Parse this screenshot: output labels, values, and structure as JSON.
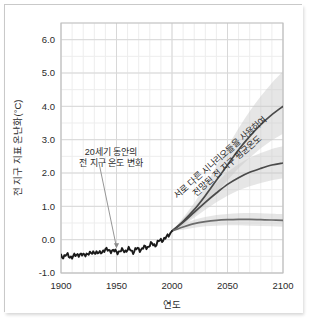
{
  "chart_data": {
    "type": "line",
    "title": "",
    "xlabel": "연도",
    "ylabel": "전 지구 지표 온난화(°C)",
    "xlim": [
      1900,
      2100
    ],
    "ylim": [
      -1.0,
      6.5
    ],
    "grid": true,
    "legend_position": "none",
    "xticks": [
      1900,
      1950,
      2000,
      2050,
      2100
    ],
    "xtick_labels": [
      "1900",
      "1950",
      "2000",
      "2050",
      "2100"
    ],
    "yticks": [
      -1.0,
      0.0,
      1.0,
      2.0,
      3.0,
      4.0,
      5.0,
      6.0
    ],
    "ytick_labels": [
      "-1.0",
      "0.0",
      "1.0",
      "2.0",
      "3.0",
      "4.0",
      "5.0",
      "6.0"
    ],
    "x_minor_step": 10,
    "y_minor_step": 0.5,
    "series": [
      {
        "name": "관측된 전 지구 지표 온난화",
        "kind": "historical",
        "color": "#1a1a1a",
        "x": [
          1900,
          1905,
          1910,
          1915,
          1920,
          1925,
          1930,
          1935,
          1940,
          1945,
          1950,
          1955,
          1960,
          1965,
          1970,
          1975,
          1980,
          1985,
          1990,
          1995,
          2000
        ],
        "values": [
          -0.5,
          -0.47,
          -0.52,
          -0.44,
          -0.46,
          -0.42,
          -0.38,
          -0.4,
          -0.3,
          -0.33,
          -0.36,
          -0.34,
          -0.3,
          -0.34,
          -0.28,
          -0.26,
          -0.16,
          -0.14,
          -0.02,
          0.06,
          0.26
        ]
      },
      {
        "name": "고배출 시나리오 전망",
        "kind": "projection",
        "color": "#4a4a4a",
        "x": [
          2000,
          2010,
          2020,
          2030,
          2040,
          2050,
          2060,
          2070,
          2080,
          2090,
          2100
        ],
        "values": [
          0.26,
          0.55,
          0.9,
          1.32,
          1.78,
          2.24,
          2.7,
          3.1,
          3.45,
          3.75,
          4.0
        ],
        "band_low": [
          0.26,
          0.45,
          0.72,
          1.05,
          1.4,
          1.78,
          2.14,
          2.46,
          2.74,
          2.98,
          3.18
        ],
        "band_high": [
          0.26,
          0.66,
          1.1,
          1.62,
          2.2,
          2.78,
          3.34,
          3.85,
          4.3,
          4.7,
          5.05
        ]
      },
      {
        "name": "중간배출 시나리오 전망",
        "kind": "projection",
        "color": "#4a4a4a",
        "x": [
          2000,
          2010,
          2020,
          2030,
          2040,
          2050,
          2060,
          2070,
          2080,
          2090,
          2100
        ],
        "values": [
          0.26,
          0.52,
          0.82,
          1.12,
          1.4,
          1.66,
          1.86,
          2.02,
          2.14,
          2.24,
          2.3
        ],
        "band_low": [
          0.26,
          0.42,
          0.66,
          0.9,
          1.12,
          1.32,
          1.48,
          1.6,
          1.7,
          1.78,
          1.84
        ],
        "band_high": [
          0.26,
          0.62,
          0.99,
          1.36,
          1.7,
          2.02,
          2.26,
          2.46,
          2.6,
          2.72,
          2.8
        ]
      },
      {
        "name": "저배출 시나리오 전망",
        "kind": "projection",
        "color": "#6b6b6b",
        "x": [
          2000,
          2010,
          2020,
          2030,
          2040,
          2050,
          2060,
          2070,
          2080,
          2090,
          2100
        ],
        "values": [
          0.26,
          0.38,
          0.48,
          0.54,
          0.58,
          0.6,
          0.61,
          0.61,
          0.6,
          0.59,
          0.58
        ],
        "band_low": [
          0.26,
          0.3,
          0.36,
          0.4,
          0.42,
          0.43,
          0.43,
          0.42,
          0.41,
          0.4,
          0.39
        ],
        "band_high": [
          0.26,
          0.46,
          0.6,
          0.68,
          0.74,
          0.77,
          0.79,
          0.8,
          0.79,
          0.78,
          0.77
        ]
      }
    ],
    "annotations": [
      {
        "name": "historical-annotation",
        "lines": [
          "20세기 동안의",
          "전 지구 온도 변화"
        ],
        "x": 1945,
        "y": 2.55,
        "arrow_to_x": 1950,
        "arrow_to_y": -0.32
      },
      {
        "name": "projection-annotation",
        "lines": [
          "서로 다른 시나리오들을 사용하여",
          "전망된 전 지구 평균온도"
        ],
        "x": 2045,
        "y": 2.4,
        "rotation_deg": -41
      }
    ],
    "colors": {
      "band_fill": "#c8c8c8",
      "grid_major": "#d8d8d8",
      "grid_minor": "#ededed",
      "axis": "#bdbdbd",
      "text": "#2b2b2b"
    }
  }
}
